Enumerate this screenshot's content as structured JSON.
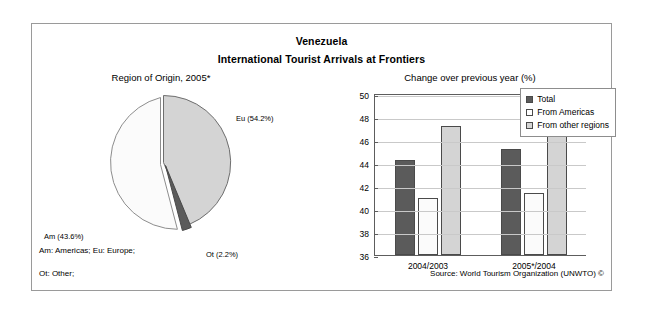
{
  "figure": {
    "title_line1": "Venezuela",
    "title_line2": "International Tourist Arrivals at Frontiers",
    "footnote_line1": "Am: Americas; Eu: Europe;",
    "footnote_line2": "Ot: Other;",
    "source": "Source: World Tourism Organization (UNWTO) ©"
  },
  "colors": {
    "total": "#5b5b5b",
    "from_americas": "#fbfbfb",
    "from_other_regions": "#d4d4d4",
    "pie_eu": "#d4d4d4",
    "pie_am": "#fbfbfb",
    "pie_ot": "#5b5b5b",
    "frame": "#9a9a9a",
    "grid": "#c9c9c9",
    "axis": "#5d5d5d"
  },
  "chart_data": [
    {
      "type": "pie",
      "title": "Region of Origin, 2005*",
      "labels": [
        "Eu",
        "Am",
        "Ot"
      ],
      "label_texts": [
        "Eu (54.2%)",
        "Am (43.6%)",
        "Ot (2.2%)"
      ],
      "values": [
        54.2,
        43.6,
        2.2
      ],
      "units": "%",
      "legend": "none",
      "exploded_slices": [
        "Ot"
      ]
    },
    {
      "type": "bar",
      "title": "Change over previous year (%)",
      "categories": [
        "2004/2003",
        "2005*/2004"
      ],
      "series": [
        {
          "name": "Total",
          "values": [
            44.3,
            45.2
          ]
        },
        {
          "name": "From Americas",
          "values": [
            41.0,
            41.4
          ]
        },
        {
          "name": "From other regions",
          "values": [
            47.2,
            48.1
          ]
        }
      ],
      "xlabel": "",
      "ylabel": "",
      "ylim": [
        36,
        50
      ],
      "yticks": [
        36,
        38,
        40,
        42,
        44,
        46,
        48,
        50
      ],
      "grid": true,
      "legend_position": "top-right"
    }
  ]
}
